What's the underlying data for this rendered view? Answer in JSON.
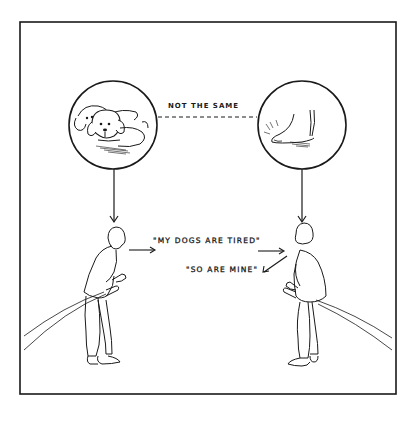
{
  "cartoon": {
    "colors": {
      "background": "#ffffff",
      "ink": "#1a1a1a"
    },
    "panels": {
      "left_circle": {
        "depicts": "two droopy-eared puppies lying down",
        "icon": "dogs-icon"
      },
      "right_circle": {
        "depicts": "a bare human foot on the ground",
        "icon": "foot-icon"
      }
    },
    "labels": {
      "comparison": "NOT THE SAME",
      "speech_1": "\"MY DOGS ARE TIRED\"",
      "speech_2": "\"SO ARE MINE\""
    },
    "figures": [
      {
        "name": "left-man",
        "role": "speaker",
        "pose": "leaning forward, facing right"
      },
      {
        "name": "right-man",
        "role": "listener/responder",
        "pose": "leaning forward, facing left"
      }
    ]
  }
}
